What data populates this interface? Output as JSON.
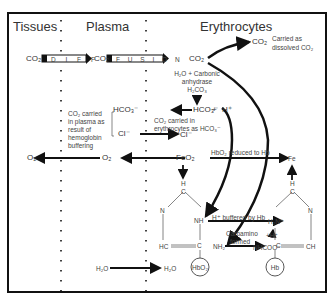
{
  "diagram": {
    "columns": {
      "tissues": "Tissues",
      "plasma": "Plasma",
      "erythrocytes": "Erythrocytes"
    },
    "diffusion_bar": {
      "left_letters": "D I F F",
      "right_letters": "F U S I O N"
    },
    "labels": {
      "co2_tissue": "CO₂",
      "co2_plasma": "CO₂",
      "co2_ery": "CO₂",
      "co2_dissolved": "CO₂",
      "dissolved_note_1": "Carried as",
      "dissolved_note_2": "dissolved CO₂",
      "carbonic_1": "H₂O + Carbonic",
      "carbonic_2": "anhydrase",
      "carbonic_3": "H₂CO₃",
      "hco3_plasma": "HCO₃⁻",
      "hco3_ery": "HCO₃⁻",
      "plus": "+",
      "hplus": "H⁺",
      "plasma_note_1": "CO₂ carried",
      "plasma_note_2": "in plasma as",
      "plasma_note_3": "result of",
      "plasma_note_4": "hemoglobin",
      "plasma_note_5": "buffering",
      "ery_note_1": "CO₂ carried in",
      "ery_note_2": "erythrocytes as HCO₃⁻",
      "cl_plasma": "Cl⁻",
      "cl_ery": "Cl⁻",
      "o2_tissue": "O₂",
      "o2_plasma": "O₂",
      "feo2": "FeO₂",
      "hbo2_reduced": "HbO₂ reduced to Hb",
      "fe": "Fe",
      "h_buffered": "H⁺ buffered by Hb",
      "carbamino_1": "Carbamino",
      "carbamino_2": "formed",
      "hbo2_circle": "HbO₂",
      "hb_circle": "Hb",
      "nh": "NH",
      "nh2": "NH₂",
      "h2n": "H₂N⁺",
      "nhcoo": "NHCOO⁻",
      "hplus_small": "+H⁺",
      "hc": "HC",
      "ch": "CH",
      "h_left": "H",
      "c_left": "C",
      "n_left": "N",
      "c_left2": "C",
      "h_right": "H",
      "c_right": "C",
      "n_right": "N",
      "c_right2": "C",
      "h2o_plasma": "H₂O",
      "h2o_ery": "H₂O"
    }
  }
}
